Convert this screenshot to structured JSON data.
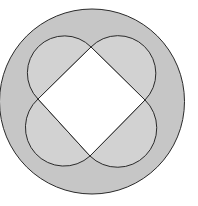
{
  "diagram": {
    "colors": {
      "background": "#ffffff",
      "outer_fill": "#c6c6c6",
      "semicircle_fill": "#d2d2d2",
      "square_fill": "#ffffff",
      "stroke": "#2a2a2a"
    },
    "outer_circle": {
      "cx": 92,
      "cy": 101.5,
      "r": 92.5
    },
    "square": {
      "vertices": {
        "top": [
          91,
          47
        ],
        "right": [
          145,
          100
        ],
        "bottom": [
          90,
          156
        ],
        "left": [
          38,
          99
        ]
      }
    },
    "semicircles": [
      {
        "name": "top-left",
        "from": "left",
        "to": "top"
      },
      {
        "name": "top-right",
        "from": "top",
        "to": "right"
      },
      {
        "name": "bottom-right",
        "from": "right",
        "to": "bottom"
      },
      {
        "name": "bottom-left",
        "from": "bottom",
        "to": "left"
      }
    ]
  }
}
